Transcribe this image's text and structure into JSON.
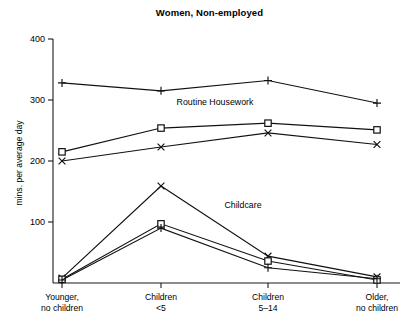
{
  "chart_data": {
    "type": "line",
    "title": "Women, Non-employed",
    "xlabel": "",
    "ylabel": "mins. per average day",
    "ylim": [
      0,
      400
    ],
    "yticks": [
      0,
      100,
      200,
      300,
      400
    ],
    "ytick_labels": [
      "",
      "100",
      "200",
      "300",
      "400"
    ],
    "grid": false,
    "legend": "none",
    "categories": [
      "Younger,\nno children",
      "Children\n<5",
      "Children\n5–14",
      "Older,\nno children"
    ],
    "category_lines": [
      [
        "Younger,",
        "no children"
      ],
      [
        "Children",
        "<5"
      ],
      [
        "Children",
        "5–14"
      ],
      [
        "Older,",
        "no children"
      ]
    ],
    "annotations": [
      {
        "text": "Routine Housework",
        "x": 215,
        "y": 105
      },
      {
        "text": "Childcare",
        "x": 243,
        "y": 208
      }
    ],
    "groups": [
      {
        "name": "Routine Housework",
        "series": [
          {
            "name": "Routine Housework - plus",
            "marker": "plus",
            "values": [
              328,
              315,
              332,
              295
            ]
          },
          {
            "name": "Routine Housework - square",
            "marker": "square",
            "values": [
              215,
              254,
              262,
              251
            ]
          },
          {
            "name": "Routine Housework - cross",
            "marker": "cross",
            "values": [
              200,
              223,
              246,
              227
            ]
          }
        ]
      },
      {
        "name": "Childcare",
        "series": [
          {
            "name": "Childcare - cross",
            "marker": "cross",
            "values": [
              8,
              159,
              44,
              10
            ]
          },
          {
            "name": "Childcare - square",
            "marker": "square",
            "values": [
              6,
              97,
              36,
              5
            ]
          },
          {
            "name": "Childcare - plus",
            "marker": "plus",
            "values": [
              5,
              90,
              25,
              7
            ]
          }
        ]
      }
    ],
    "colors": {
      "line": "#111111",
      "axis": "#1a1a1a",
      "background": "#ffffff"
    }
  }
}
